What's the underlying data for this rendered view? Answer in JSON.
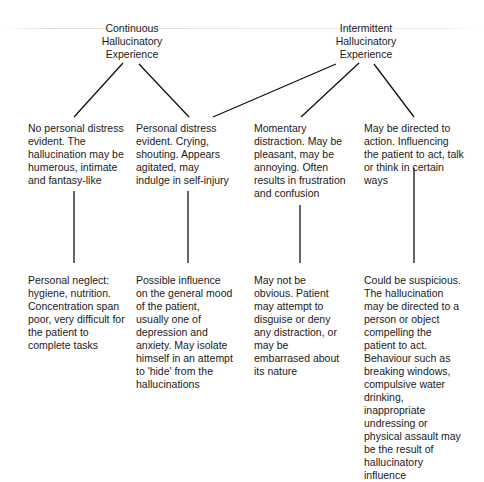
{
  "diagram": {
    "roots": [
      {
        "id": "continuous",
        "lines": [
          "Continuous",
          "Hallucinatory",
          "Experience"
        ]
      },
      {
        "id": "intermittent",
        "lines": [
          "Intermittent",
          "Hallucinatory",
          "Experience"
        ]
      }
    ],
    "level1": [
      {
        "text": "No personal distress evident. The hallucination may be humerous, intimate and fantasy-like"
      },
      {
        "text": "Personal distress evident. Crying, shouting. Appears agitated, may indulge in self-injury"
      },
      {
        "text": "Momentary distraction. May be pleasant, may be annoying. Often results in frustration and confusion"
      },
      {
        "text": "May be directed to action. Influencing the patient to act, talk or think in certain ways"
      }
    ],
    "level2": [
      {
        "text": "Personal neglect: hygiene, nutrition. Concentration span poor, very difficult for the patient to complete tasks"
      },
      {
        "text": "Possible influence on the general mood of the patient, usually one of depression and anxiety. May isolate himself in an attempt to 'hide' from the hallucinations"
      },
      {
        "text": "May not be obvious. Patient may attempt to disguise or deny any distraction, or may be embarrased about its nature"
      },
      {
        "text": "Could be suspicious. The hallucination may be directed to a person or object compelling the patient to act. Behaviour such as breaking windows, compulsive water drinking, inappropriate undressing or physical assault may be the result of hallucinatory influence"
      }
    ],
    "edges": [
      {
        "from": "continuous",
        "to": "level1.0"
      },
      {
        "from": "continuous",
        "to": "level1.1"
      },
      {
        "from": "intermittent",
        "to": "level1.1"
      },
      {
        "from": "intermittent",
        "to": "level1.2"
      },
      {
        "from": "intermittent",
        "to": "level1.3"
      },
      {
        "from": "level1.0",
        "to": "level2.0"
      },
      {
        "from": "level1.1",
        "to": "level2.1"
      },
      {
        "from": "level1.2",
        "to": "level2.2"
      },
      {
        "from": "level1.3",
        "to": "level2.3"
      }
    ],
    "line_color": "#111111"
  }
}
